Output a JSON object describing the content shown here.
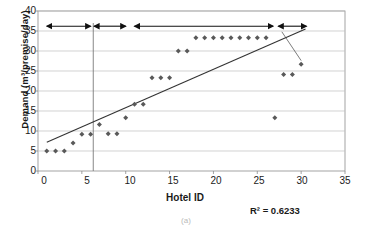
{
  "chart_data": {
    "type": "scatter",
    "title": "",
    "xlabel": "Hotel ID",
    "ylabel": "Demand (m³/premise/day)",
    "xlim": [
      0,
      35
    ],
    "ylim": [
      0,
      40
    ],
    "xticks": [
      0,
      5,
      10,
      15,
      20,
      25,
      30,
      35
    ],
    "yticks": [
      0,
      5,
      10,
      15,
      20,
      25,
      30,
      35,
      40
    ],
    "grid": "horizontal",
    "legend": "none",
    "annotations": [
      {
        "name": "r-squared",
        "text": "R² = 0.6233"
      }
    ],
    "series": [
      {
        "name": "Demand per hotel",
        "marker": "diamond",
        "color": "#595959",
        "points": [
          {
            "x": 1,
            "y": 5.0
          },
          {
            "x": 2,
            "y": 5.0
          },
          {
            "x": 3,
            "y": 5.0
          },
          {
            "x": 4,
            "y": 7.0
          },
          {
            "x": 5,
            "y": 9.2
          },
          {
            "x": 6,
            "y": 9.2
          },
          {
            "x": 7,
            "y": 11.6
          },
          {
            "x": 8,
            "y": 9.3
          },
          {
            "x": 9,
            "y": 9.3
          },
          {
            "x": 10,
            "y": 13.3
          },
          {
            "x": 11,
            "y": 16.7
          },
          {
            "x": 12,
            "y": 16.7
          },
          {
            "x": 13,
            "y": 23.3
          },
          {
            "x": 14,
            "y": 23.3
          },
          {
            "x": 15,
            "y": 23.3
          },
          {
            "x": 16,
            "y": 30.0
          },
          {
            "x": 17,
            "y": 30.0
          },
          {
            "x": 18,
            "y": 33.3
          },
          {
            "x": 19,
            "y": 33.3
          },
          {
            "x": 20,
            "y": 33.3
          },
          {
            "x": 21,
            "y": 33.3
          },
          {
            "x": 22,
            "y": 33.3
          },
          {
            "x": 23,
            "y": 33.3
          },
          {
            "x": 24,
            "y": 33.3
          },
          {
            "x": 25,
            "y": 33.3
          },
          {
            "x": 26,
            "y": 33.3
          },
          {
            "x": 27,
            "y": 13.3
          },
          {
            "x": 28,
            "y": 24.1
          },
          {
            "x": 29,
            "y": 24.1
          },
          {
            "x": 30,
            "y": 26.7
          }
        ]
      }
    ],
    "trendline": {
      "name": "linear-trendline",
      "color": "#333333",
      "x0": 1.0,
      "y0": 7.2,
      "x1": 30.5,
      "y1": 35.5,
      "r_squared": 0.6233
    },
    "category_brackets": [
      {
        "label": "Hostels",
        "x_start": 1,
        "x_end": 6,
        "y": 36.2
      },
      {
        "label": "2 stars",
        "x_start": 6.4,
        "x_end": 10,
        "y": 36.2
      },
      {
        "label": "3 stars",
        "x_start": 11,
        "x_end": 26.8,
        "y": 36.2
      },
      {
        "label": "4 stars",
        "x_start": 27.4,
        "x_end": 30.6,
        "y": 36.2
      }
    ],
    "divider_lines": [
      {
        "name": "hostels-boundary",
        "x": 6.3,
        "y_top": 37.0,
        "y_bottom": 0
      }
    ]
  },
  "figure": {
    "caption": "(a)"
  }
}
